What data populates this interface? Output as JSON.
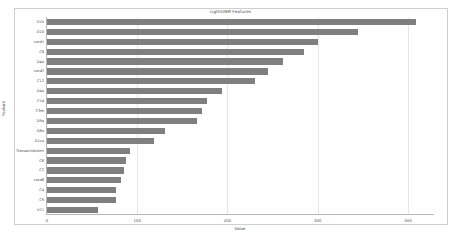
{
  "chart_data": {
    "type": "bar",
    "orientation": "horizontal",
    "title": "LightGBM Features",
    "xlabel": "Value",
    "ylabel": "Feature",
    "xlim": [
      0,
      430
    ],
    "xticks": [
      0,
      100,
      200,
      300,
      400
    ],
    "grid": true,
    "legend": false,
    "bar_color": "#7f7f7f",
    "categories": [
      "D15",
      "D10",
      "card1",
      "C8",
      "D4a",
      "card2",
      "C12",
      "D4a",
      "C14",
      "C3m",
      "D9a",
      "D8a",
      "D1ca",
      "TransactionAmt",
      "C6",
      "C2",
      "card6",
      "C4",
      "C9",
      "V71"
    ],
    "values": [
      409,
      345,
      300,
      285,
      262,
      245,
      231,
      194,
      177,
      172,
      166,
      131,
      119,
      92,
      88,
      85,
      82,
      76,
      76,
      57
    ]
  },
  "figure": {
    "background": "#ffffff",
    "frame_color": "#cfcfcf",
    "axis_color": "#b8b8b8",
    "grid_color": "#e6e6e6",
    "text_color": "#4a4a4a"
  }
}
